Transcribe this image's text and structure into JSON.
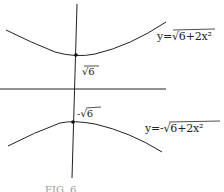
{
  "diagram": {
    "type": "hand-drawn graph of hyperbola",
    "curves": [
      {
        "id": "upper",
        "equation": "y=√6+2x²",
        "display": "y=√6+2x²"
      },
      {
        "id": "lower",
        "equation": "y=-√6+2x²",
        "display": "y=-√6+2x²"
      }
    ],
    "points": [
      {
        "label": "√6"
      },
      {
        "label": "-√6"
      }
    ],
    "caption": "FIG. 6",
    "colors": {
      "ink": "#222222",
      "background": "#ffffff"
    }
  }
}
